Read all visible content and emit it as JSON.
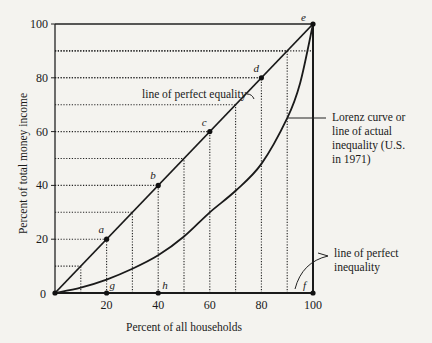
{
  "chart_data": {
    "type": "line",
    "title": "",
    "xlabel": "Percent of all households",
    "ylabel": "Percent of total money income",
    "xlim": [
      0,
      100
    ],
    "ylim": [
      0,
      100
    ],
    "x_ticks": [
      "0",
      "20",
      "40",
      "60",
      "80",
      "100"
    ],
    "y_ticks": [
      "20",
      "40",
      "60",
      "80",
      "100"
    ],
    "x_tick_values": [
      20,
      40,
      60,
      80,
      100
    ],
    "y_tick_values": [
      20,
      40,
      60,
      80,
      100
    ],
    "origin_label": "0",
    "gridlines": "dotted guides at every 10",
    "guide_values": [
      10,
      20,
      30,
      40,
      50,
      60,
      70,
      80,
      90
    ],
    "series": [
      {
        "name": "line of perfect equality",
        "x": [
          0,
          100
        ],
        "y": [
          0,
          100
        ]
      },
      {
        "name": "Lorenz curve or line of actual inequality (U.S. in 1971)",
        "x": [
          0,
          10,
          20,
          30,
          40,
          50,
          60,
          70,
          80,
          90,
          95,
          100
        ],
        "y": [
          0,
          2,
          5,
          9,
          14,
          21,
          30,
          38,
          48,
          65,
          78,
          100
        ]
      },
      {
        "name": "line of perfect inequality",
        "x": [
          0,
          100,
          100
        ],
        "y": [
          0,
          0,
          100
        ]
      }
    ],
    "points": [
      {
        "label": "a",
        "x": 20,
        "y": 20
      },
      {
        "label": "b",
        "x": 40,
        "y": 40
      },
      {
        "label": "c",
        "x": 60,
        "y": 60
      },
      {
        "label": "d",
        "x": 80,
        "y": 80
      },
      {
        "label": "e",
        "x": 100,
        "y": 100
      },
      {
        "label": "f",
        "x": 100,
        "y": 0
      },
      {
        "label": "g",
        "x": 20,
        "y": 0
      },
      {
        "label": "h",
        "x": 40,
        "y": 0
      }
    ],
    "annotations": [
      {
        "text": "line of perfect equality"
      },
      {
        "lines": [
          "Lorenz curve or",
          "line of actual",
          "inequality (U.S.",
          "in 1971)"
        ]
      },
      {
        "lines": [
          "line of perfect",
          "inequality"
        ]
      }
    ]
  }
}
